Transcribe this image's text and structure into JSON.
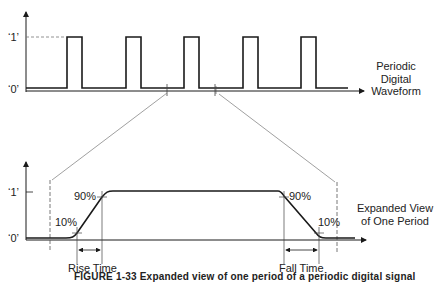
{
  "figure": {
    "caption": "FIGURE 1-33   Expanded view of one period of a periodic digital signal"
  },
  "top_panel": {
    "y_label_high": "‘1’",
    "y_label_low": "‘0’",
    "side_label_line1": "Periodic",
    "side_label_line2": "Digital",
    "side_label_line3": "Waveform",
    "pulse_count": 5,
    "pulses_x": [
      [
        67,
        82
      ],
      [
        126,
        141
      ],
      [
        184,
        199
      ],
      [
        243,
        258
      ],
      [
        301,
        316
      ]
    ],
    "period_markers_x": [
      167,
      215
    ]
  },
  "bottom_panel": {
    "y_label_high": "‘1’",
    "y_label_low": "‘0’",
    "rise_high_pct": "90%",
    "rise_low_pct": "10%",
    "fall_high_pct": "90%",
    "fall_low_pct": "10%",
    "rise_time_label": "Rise Time",
    "fall_time_label": "Fall Time",
    "side_label_line1": "Expanded View",
    "side_label_line2": "of One Period"
  },
  "colors": {
    "line": "#1a1a1a",
    "guide": "#777777",
    "text": "#222222"
  }
}
